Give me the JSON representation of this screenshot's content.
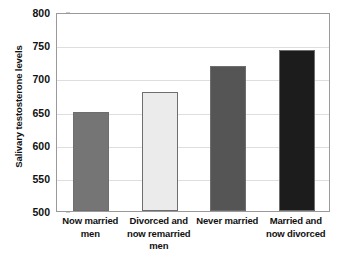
{
  "chart_data": {
    "type": "bar",
    "title": "",
    "subtitle": "",
    "xlabel": "",
    "ylabel": "Salivary testosterone levels",
    "ylim": [
      500,
      800
    ],
    "yticks": [
      500,
      550,
      600,
      650,
      700,
      750,
      800
    ],
    "ytick_labels": [
      "500",
      "550",
      "600",
      "650",
      "700",
      "750",
      "800"
    ],
    "grid": "horizontal",
    "legend": "none",
    "categories": [
      "Now married men",
      "Divorced and now remarried men",
      "Never married",
      "Married and now divorced"
    ],
    "category_lines": [
      [
        "Now married",
        "men"
      ],
      [
        "Divorced and",
        "now remarried",
        "men"
      ],
      [
        "Never married"
      ],
      [
        "Married and",
        "now divorced"
      ]
    ],
    "values": [
      650,
      680,
      719,
      742
    ],
    "series": [
      {
        "name": "Salivary testosterone levels",
        "values": [
          650,
          680,
          719,
          742
        ]
      }
    ],
    "bar_colors": [
      "#757575",
      "#ebebeb",
      "#555555",
      "#1c1c1c"
    ],
    "bar_border_color": "#6e6e6e",
    "plot_border_color": "#9a9a9a",
    "gridline_color": "#dedede",
    "background_color": "#ffffff",
    "text_color": "#111111"
  }
}
